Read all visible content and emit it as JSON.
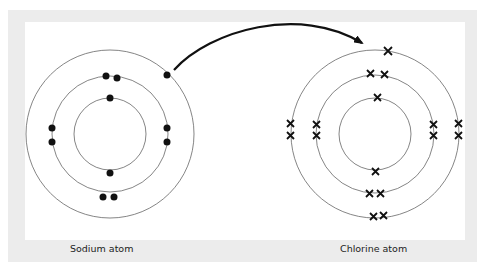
{
  "diagram": {
    "title": "",
    "colors": {
      "frame": "#ececec",
      "panel": "#ffffff",
      "shell": "#666666",
      "electron": "#111111",
      "arrow": "#111111"
    },
    "sodium": {
      "label": "Sodium atom",
      "electron_symbol": "dot",
      "shells": [
        2,
        8,
        1
      ]
    },
    "chlorine": {
      "label": "Chlorine atom",
      "electron_symbol": "cross",
      "shells": [
        2,
        8,
        7
      ]
    },
    "arrow": {
      "from": "sodium outer electron",
      "to": "chlorine outer shell"
    }
  }
}
